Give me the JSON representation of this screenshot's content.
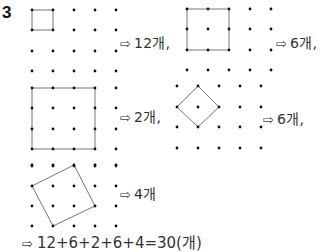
{
  "problem_number": "3",
  "answers": [
    {
      "id": "a1",
      "text": "12개,",
      "x": 120,
      "y": 32
    },
    {
      "id": "a2",
      "text": "6개,",
      "x": 276,
      "y": 32
    },
    {
      "id": "a3",
      "text": "2개,",
      "x": 120,
      "y": 106
    },
    {
      "id": "a4",
      "text": "6개,",
      "x": 263,
      "y": 108
    },
    {
      "id": "a5",
      "text": "4개",
      "x": 120,
      "y": 183
    }
  ],
  "arrow_glyph": "⇨",
  "final_answer": "12+6+2+6+4=30(개)",
  "grids": [
    {
      "id": "grid-top-left",
      "xs": [
        32,
        53,
        74,
        95,
        116
      ],
      "ys": [
        10,
        30,
        51,
        71
      ]
    },
    {
      "id": "grid-top-right",
      "xs": [
        187,
        208,
        229,
        250,
        271
      ],
      "ys": [
        9,
        29,
        50,
        70
      ]
    },
    {
      "id": "grid-mid-left",
      "xs": [
        32,
        53,
        74,
        95,
        116
      ],
      "ys": [
        88,
        108,
        129,
        149,
        166
      ]
    },
    {
      "id": "grid-mid-right",
      "xs": [
        177,
        198,
        219,
        240,
        261
      ],
      "ys": [
        86,
        107,
        127,
        148
      ]
    },
    {
      "id": "grid-bottom-left",
      "xs": [
        32,
        53,
        74,
        95,
        116
      ],
      "ys": [
        165,
        186,
        206,
        226
      ]
    }
  ],
  "shapes": [
    {
      "id": "square-1x1",
      "points": [
        [
          32,
          10
        ],
        [
          53,
          10
        ],
        [
          53,
          30
        ],
        [
          32,
          30
        ]
      ]
    },
    {
      "id": "square-2x2",
      "points": [
        [
          187,
          9
        ],
        [
          229,
          9
        ],
        [
          229,
          50
        ],
        [
          187,
          50
        ]
      ]
    },
    {
      "id": "square-3x3",
      "points": [
        [
          32,
          88
        ],
        [
          95,
          88
        ],
        [
          95,
          149
        ],
        [
          32,
          149
        ]
      ]
    },
    {
      "id": "square-diamond",
      "points": [
        [
          198,
          86
        ],
        [
          219,
          107
        ],
        [
          198,
          127
        ],
        [
          177,
          107
        ]
      ]
    },
    {
      "id": "square-tilted",
      "points": [
        [
          74,
          165
        ],
        [
          95,
          206
        ],
        [
          53,
          226
        ],
        [
          32,
          186
        ]
      ]
    }
  ],
  "colors": {
    "dot": "#111111",
    "line": "#777777"
  }
}
